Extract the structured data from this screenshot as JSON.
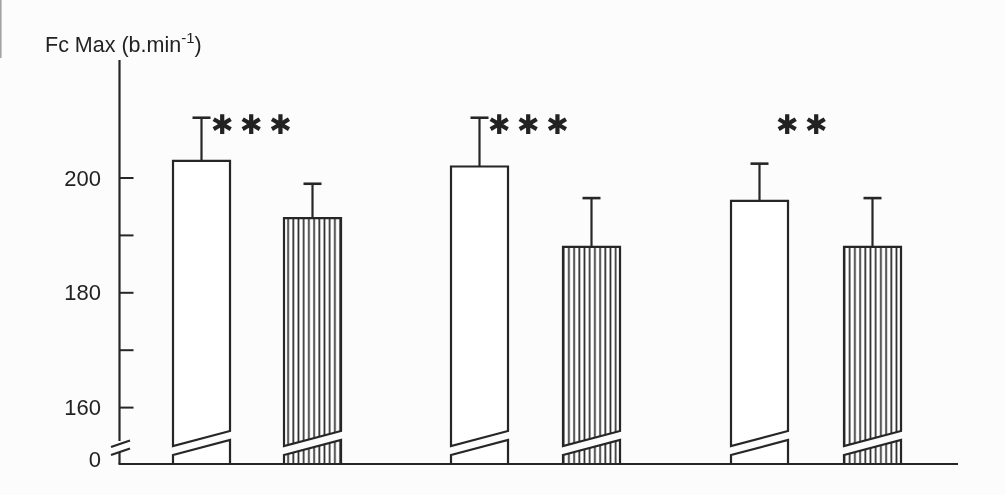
{
  "figure": {
    "background": "#fcfcfc",
    "ink_color": "#262626"
  },
  "title": {
    "prefix": "Fc Max (b.min",
    "superscript": "-1",
    "suffix": ")"
  },
  "chart_data": {
    "type": "bar",
    "xlabel": "",
    "ylabel": "Fc Max (b.min⁻¹)",
    "grid": false,
    "legend": "none",
    "y_axis": {
      "ticks_labeled": [
        {
          "value": 0,
          "label": "0"
        },
        {
          "value": 160,
          "label": "160"
        },
        {
          "value": 180,
          "label": "180"
        },
        {
          "value": 200,
          "label": "200"
        }
      ],
      "ticks_minor": [
        170,
        190
      ],
      "axis_break": true,
      "axis_break_between": [
        0,
        155
      ],
      "display_range": [
        155,
        212
      ]
    },
    "series": [
      {
        "key": "open",
        "fill": "plain-white",
        "values": [
          203,
          202,
          196
        ],
        "error_sd": [
          7.5,
          8.5,
          6.5
        ]
      },
      {
        "key": "striped",
        "fill": "vertical-stripes",
        "values": [
          193,
          188,
          188
        ],
        "error_sd": [
          6.0,
          8.5,
          8.5
        ]
      }
    ],
    "groups": [
      {
        "bars": [
          {
            "series": "open",
            "value": 203,
            "error_sd": 7.5
          },
          {
            "series": "striped",
            "value": 193,
            "error_sd": 6.0
          }
        ],
        "significance": "***"
      },
      {
        "bars": [
          {
            "series": "open",
            "value": 202,
            "error_sd": 8.5
          },
          {
            "series": "striped",
            "value": 188,
            "error_sd": 8.5
          }
        ],
        "significance": "***"
      },
      {
        "bars": [
          {
            "series": "open",
            "value": 196,
            "error_sd": 6.5
          },
          {
            "series": "striped",
            "value": 188,
            "error_sd": 8.5
          }
        ],
        "significance": "**"
      }
    ],
    "annotations": {
      "error_bars": "upper whisker with cap, drawn from bar top",
      "bar_breaks": "each bar has a diagonal break cut near its base matching the y-axis break"
    }
  }
}
